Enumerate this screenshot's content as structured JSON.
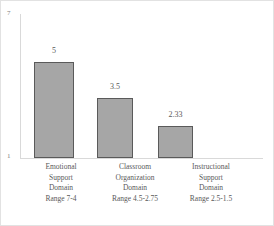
{
  "chart_data": {
    "type": "bar",
    "title": "",
    "xlabel": "",
    "ylabel": "",
    "ylim": [
      1,
      7
    ],
    "grid": false,
    "legend": null,
    "categories": [
      "Emotional Support Domain Range 7-4",
      "Classroom Organization Domain Range 4.5-2.75",
      "Instructional Support Domain Range 2.5-1.5"
    ],
    "values": [
      5,
      3.5,
      2.33
    ],
    "value_labels": [
      "5",
      "3.5",
      "2.33"
    ],
    "y_ticks": [
      "7",
      "1"
    ],
    "category_lines": [
      [
        "Emotional",
        "Support",
        "Domain",
        "Range 7-4"
      ],
      [
        "Classroom",
        "Organization",
        "Domain",
        "Range 4.5-2.75"
      ],
      [
        "Instructional",
        "Support",
        "Domain",
        "Range 2.5-1.5"
      ]
    ],
    "colors": {
      "bar_fill": "#a6a6a6",
      "bar_border": "#5a5a5a",
      "axis": "#d9d9d9",
      "text": "#595959",
      "frame": "#e2e2e2",
      "background": "#ffffff"
    }
  }
}
